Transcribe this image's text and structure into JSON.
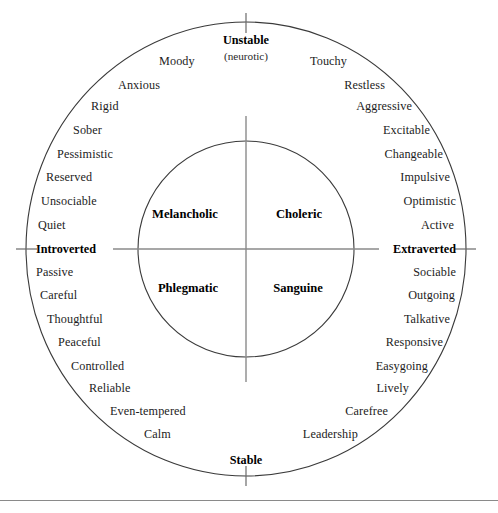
{
  "chart_data": {
    "type": "scatter",
    "xlabel": "Introversion–Extraversion",
    "ylabel": "Stability–Instability",
    "grid": false,
    "legend": "none",
    "axes": {
      "top": {
        "label": "Unstable",
        "sublabel": "(neurotic)"
      },
      "bottom": {
        "label": "Stable",
        "sublabel": ""
      },
      "left": {
        "label": "Introverted",
        "sublabel": ""
      },
      "right": {
        "label": "Extraverted",
        "sublabel": ""
      }
    },
    "quadrants": [
      {
        "name": "Melancholic",
        "position": "upper-left",
        "x": 185,
        "y": 214
      },
      {
        "name": "Choleric",
        "position": "upper-right",
        "x": 299,
        "y": 214
      },
      {
        "name": "Phlegmatic",
        "position": "lower-left",
        "x": 188,
        "y": 288
      },
      {
        "name": "Sanguine",
        "position": "lower-right",
        "x": 298,
        "y": 288
      }
    ],
    "traits": [
      {
        "label": "Moody",
        "quadrant": "Melancholic",
        "side": "left",
        "x": 159,
        "y": 61
      },
      {
        "label": "Anxious",
        "quadrant": "Melancholic",
        "side": "left",
        "x": 118,
        "y": 85
      },
      {
        "label": "Rigid",
        "quadrant": "Melancholic",
        "side": "left",
        "x": 91,
        "y": 106
      },
      {
        "label": "Sober",
        "quadrant": "Melancholic",
        "side": "left",
        "x": 73,
        "y": 130
      },
      {
        "label": "Pessimistic",
        "quadrant": "Melancholic",
        "side": "left",
        "x": 57,
        "y": 154
      },
      {
        "label": "Reserved",
        "quadrant": "Melancholic",
        "side": "left",
        "x": 46,
        "y": 177
      },
      {
        "label": "Unsociable",
        "quadrant": "Melancholic",
        "side": "left",
        "x": 41,
        "y": 201
      },
      {
        "label": "Quiet",
        "quadrant": "Melancholic",
        "side": "left",
        "x": 38,
        "y": 225
      },
      {
        "label": "Passive",
        "quadrant": "Phlegmatic",
        "side": "left",
        "x": 36,
        "y": 272
      },
      {
        "label": "Careful",
        "quadrant": "Phlegmatic",
        "side": "left",
        "x": 40,
        "y": 295
      },
      {
        "label": "Thoughtful",
        "quadrant": "Phlegmatic",
        "side": "left",
        "x": 47,
        "y": 319
      },
      {
        "label": "Peaceful",
        "quadrant": "Phlegmatic",
        "side": "left",
        "x": 58,
        "y": 342
      },
      {
        "label": "Controlled",
        "quadrant": "Phlegmatic",
        "side": "left",
        "x": 71,
        "y": 366
      },
      {
        "label": "Reliable",
        "quadrant": "Phlegmatic",
        "side": "left",
        "x": 89,
        "y": 388
      },
      {
        "label": "Even-tempered",
        "quadrant": "Phlegmatic",
        "side": "left",
        "x": 110,
        "y": 411
      },
      {
        "label": "Calm",
        "quadrant": "Phlegmatic",
        "side": "left",
        "x": 144,
        "y": 434
      },
      {
        "label": "Touchy",
        "quadrant": "Choleric",
        "side": "right",
        "x": 347,
        "y": 61
      },
      {
        "label": "Restless",
        "quadrant": "Choleric",
        "side": "right",
        "x": 385,
        "y": 85
      },
      {
        "label": "Aggressive",
        "quadrant": "Choleric",
        "side": "right",
        "x": 412,
        "y": 106
      },
      {
        "label": "Excitable",
        "quadrant": "Choleric",
        "side": "right",
        "x": 430,
        "y": 130
      },
      {
        "label": "Changeable",
        "quadrant": "Choleric",
        "side": "right",
        "x": 443,
        "y": 154
      },
      {
        "label": "Impulsive",
        "quadrant": "Choleric",
        "side": "right",
        "x": 450,
        "y": 177
      },
      {
        "label": "Optimistic",
        "quadrant": "Choleric",
        "side": "right",
        "x": 456,
        "y": 201
      },
      {
        "label": "Active",
        "quadrant": "Choleric",
        "side": "right",
        "x": 454,
        "y": 225
      },
      {
        "label": "Sociable",
        "quadrant": "Sanguine",
        "side": "right",
        "x": 456,
        "y": 272
      },
      {
        "label": "Outgoing",
        "quadrant": "Sanguine",
        "side": "right",
        "x": 455,
        "y": 295
      },
      {
        "label": "Talkative",
        "quadrant": "Sanguine",
        "side": "right",
        "x": 450,
        "y": 319
      },
      {
        "label": "Responsive",
        "quadrant": "Sanguine",
        "side": "right",
        "x": 443,
        "y": 342
      },
      {
        "label": "Easygoing",
        "quadrant": "Sanguine",
        "side": "right",
        "x": 428,
        "y": 366
      },
      {
        "label": "Lively",
        "quadrant": "Sanguine",
        "side": "right",
        "x": 409,
        "y": 388
      },
      {
        "label": "Carefree",
        "quadrant": "Sanguine",
        "side": "right",
        "x": 388,
        "y": 411
      },
      {
        "label": "Leadership",
        "quadrant": "Sanguine",
        "side": "right",
        "x": 358,
        "y": 434
      }
    ]
  },
  "geometry": {
    "center_x": 246,
    "center_y": 249,
    "outer_rx": 220,
    "outer_ry": 227,
    "inner_r": 108,
    "axis_half_len": 133,
    "tick_len": 18
  },
  "colors": {
    "stroke": "#3a3a3a",
    "axis": "#8a8a8a",
    "text": "#1c1c1c",
    "bold_text": "#000000",
    "background": "#ffffff",
    "rule": "#8a8a8a"
  },
  "labels": {
    "top_axis": "Unstable",
    "top_axis_sub": "(neurotic)",
    "bottom_axis": "Stable",
    "left_axis": "Introverted",
    "right_axis": "Extraverted"
  }
}
